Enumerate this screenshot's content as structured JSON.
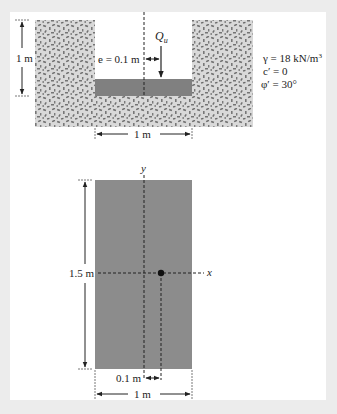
{
  "section": {
    "depth_label": "1 m",
    "width_label": "1 m",
    "eccentricity_label": "e = 0.1 m",
    "load_label": "Q",
    "load_subscript": "u"
  },
  "soil_properties": {
    "unit_weight": "γ = 18 kN/m",
    "unit_weight_exp": "3",
    "cohesion": "c′ = 0",
    "friction_angle": "φ′ = 30°"
  },
  "plan": {
    "y_axis_label": "y",
    "x_axis_label": "x",
    "length_label": "1.5 m",
    "eccentricity_label": "0.1 m",
    "width_label": "1 m"
  },
  "colors": {
    "background": "#ececec",
    "panel": "#ffffff",
    "soil": "#d9d9d9",
    "footing": "#808080",
    "plan_footing": "#8c8c8c",
    "line": "#222222"
  }
}
